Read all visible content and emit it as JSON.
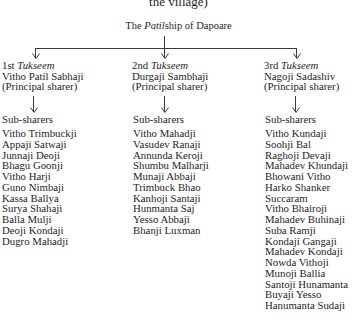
{
  "caption_fragment": "the village)",
  "root": {
    "prefix": "The ",
    "italic": "Patil",
    "suffix": "ship of Dapoare"
  },
  "columns": [
    {
      "ordinal": "1st",
      "tukseem": "Tukseem",
      "principal_name": "Vitho Patil Sabhaji",
      "principal_role": "(Principal sharer)",
      "sub_label": "Sub-sharers",
      "sub_sharers": [
        "Vitho Trimbuckji",
        "Appaji Satwaji",
        "Junnaji Deoji",
        "Bhagu Goonji",
        "Vitho Harji",
        "Guno Nimbaji",
        "Kassa Ballya",
        "Surya Shahaji",
        "Balla Mulji",
        "Deoji Kondaji",
        "Dugro Mahadji"
      ]
    },
    {
      "ordinal": "2nd",
      "tukseem": "Tukseem",
      "principal_name": "Durgaji Sambhaji",
      "principal_role": "(Principal sharer)",
      "sub_label": "Sub-sharers",
      "sub_sharers": [
        "Vitho Mahadji",
        "Vasudev Ranaji",
        "Annunda Keroji",
        "Shumbu Malharji",
        "Munaji Abbaji",
        "Trimbuck Bhao",
        "Kanhoji Santaji",
        "Hunmanta Saj",
        "Yesso Abbaji",
        "Bhanji Luxman"
      ]
    },
    {
      "ordinal": "3rd",
      "tukseem": "Tukseem",
      "principal_name": "Nagoji Sadashiv",
      "principal_role": "(Principal sharer)",
      "sub_label": "Sub-sharers",
      "sub_sharers": [
        "Vitho Kundaji",
        "Soohji Bal",
        "Raghoji Devaji",
        "Mahadev Khundaji",
        "Bhowani Vitho",
        "Harko Shanker",
        "Succaram",
        "Vitho Bhairoji",
        "Mahadev Buhinaji",
        "Suba Ramji",
        "Kondaji Gangaji",
        "Mahadev Kondaji",
        "Nowda Vithoji",
        "Munoji Ballia",
        "Santoji Hunamanta",
        "Buyaji Yesso",
        "Hanumanta Sudaji"
      ]
    }
  ]
}
